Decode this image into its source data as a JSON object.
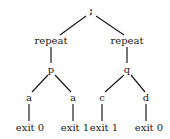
{
  "diagram": {
    "type": "tree",
    "nodes": {
      "root": {
        "label": ";",
        "x": 91,
        "y": 14
      },
      "repeat_left": {
        "label": "repeat",
        "x": 51,
        "y": 44
      },
      "repeat_right": {
        "label": "repeat",
        "x": 127,
        "y": 44
      },
      "p": {
        "label": "p",
        "x": 51,
        "y": 72
      },
      "q": {
        "label": "q",
        "x": 127,
        "y": 72
      },
      "a_left": {
        "label": "a",
        "x": 29,
        "y": 101
      },
      "a_right": {
        "label": "a",
        "x": 73,
        "y": 101
      },
      "c": {
        "label": "c",
        "x": 102,
        "y": 101
      },
      "d": {
        "label": "d",
        "x": 146,
        "y": 101
      },
      "exit_1": {
        "label": "exit 0",
        "x": 30,
        "y": 130
      },
      "exit_2": {
        "label": "exit 1",
        "x": 74,
        "y": 130
      },
      "exit_3": {
        "label": "exit 1",
        "x": 103,
        "y": 130
      },
      "exit_4": {
        "label": "exit 0",
        "x": 148,
        "y": 130
      }
    },
    "edges": [
      [
        "root",
        "repeat_left"
      ],
      [
        "root",
        "repeat_right"
      ],
      [
        "repeat_left",
        "p"
      ],
      [
        "repeat_right",
        "q"
      ],
      [
        "p",
        "a_left"
      ],
      [
        "p",
        "a_right"
      ],
      [
        "q",
        "c"
      ],
      [
        "q",
        "d"
      ],
      [
        "a_left",
        "exit_1"
      ],
      [
        "a_right",
        "exit_2"
      ],
      [
        "c",
        "exit_3"
      ],
      [
        "d",
        "exit_4"
      ]
    ]
  }
}
